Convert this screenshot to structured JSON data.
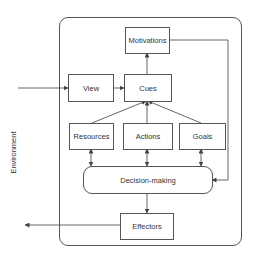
{
  "diagram": {
    "environment_label": "Environment",
    "nodes": {
      "motivations": "Motivations",
      "view": "View",
      "cues": "Cues",
      "resources": "Resources",
      "actions": "Actions",
      "goals": "Goals",
      "decision_making": "Decision-making",
      "effectors": "Effectors"
    },
    "edges": [
      {
        "from": "environment",
        "to": "view"
      },
      {
        "from": "view",
        "to": "cues"
      },
      {
        "from": "cues",
        "to": "motivations"
      },
      {
        "from": "resources",
        "to": "cues"
      },
      {
        "from": "actions",
        "to": "cues"
      },
      {
        "from": "goals",
        "to": "cues"
      },
      {
        "from": "resources",
        "to": "decision_making",
        "bidirectional": true
      },
      {
        "from": "actions",
        "to": "decision_making",
        "bidirectional": true
      },
      {
        "from": "goals",
        "to": "decision_making",
        "bidirectional": true
      },
      {
        "from": "motivations",
        "to": "decision_making"
      },
      {
        "from": "decision_making",
        "to": "effectors"
      },
      {
        "from": "effectors",
        "to": "environment"
      }
    ],
    "colors": {
      "line": "#555555",
      "text": "#333333",
      "background": "#ffffff"
    }
  }
}
